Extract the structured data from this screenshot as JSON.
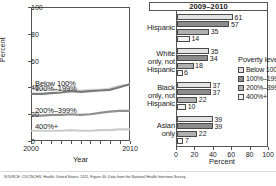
{
  "source_note": "SOURCE: CDC/NCHS, Health, United States, 2011, Figure 40. Data from the National Health Interview Survey.",
  "colors": {
    "below100": "#e2e2e2",
    "p100_199": "#8c8c8c",
    "p200_399": "#b0b0b0",
    "p400plus": "#f2f2f2",
    "axis": "#555555",
    "line_below100": "#d9d9d9",
    "line_100_199": "#7a7a7a",
    "line_200_399": "#8f8f8f",
    "line_400plus": "#cccccc"
  },
  "legend": {
    "title": "Poverty level",
    "items": [
      {
        "label": "Below 100%",
        "color": "#e2e2e2"
      },
      {
        "label": "100%–199%",
        "color": "#8c8c8c"
      },
      {
        "label": "200%–399%",
        "color": "#b0b0b0"
      },
      {
        "label": "400%+",
        "color": "#f2f2f2"
      }
    ]
  },
  "chart_data": [
    {
      "type": "line",
      "panel": "left",
      "title": "",
      "xlabel": "Year",
      "ylabel": "Percent",
      "xlim": [
        2000,
        2010
      ],
      "ylim": [
        0,
        100
      ],
      "yticks": [
        0,
        20,
        40,
        60,
        80,
        100
      ],
      "xticks": [
        2000,
        2001,
        2002,
        2003,
        2004,
        2005,
        2006,
        2007,
        2008,
        2009,
        2010
      ],
      "xticklabels": [
        "2000",
        "",
        "",
        "",
        "",
        "",
        "",
        "",
        "",
        "",
        "2010"
      ],
      "grid": false,
      "legend_position": "inline-labels",
      "x": [
        2000,
        2001,
        2002,
        2003,
        2004,
        2005,
        2006,
        2007,
        2008,
        2009,
        2010
      ],
      "series": [
        {
          "name": "Below 100%",
          "label": "Below 100%",
          "color": "#d9d9d9",
          "values": [
            39,
            38.5,
            38,
            38,
            38,
            37.5,
            38,
            38,
            39,
            41,
            42
          ]
        },
        {
          "name": "100%–199%",
          "label": "100%–199%",
          "color": "#7a7a7a",
          "values": [
            35,
            35,
            35.5,
            36,
            37,
            36.5,
            37,
            37.5,
            38,
            40,
            42
          ]
        },
        {
          "name": "200%–399%",
          "label": "200%–399%",
          "color": "#8f8f8f",
          "values": [
            18.5,
            18.5,
            19,
            19,
            19.5,
            19,
            19.5,
            20.5,
            21.5,
            22,
            22
          ]
        },
        {
          "name": "400%+",
          "label": "400%+",
          "color": "#cccccc",
          "values": [
            7,
            7,
            7,
            7,
            7.5,
            7,
            7,
            7.5,
            7.5,
            8,
            8
          ]
        }
      ]
    },
    {
      "type": "bar",
      "panel": "right",
      "orientation": "horizontal",
      "title": "2009–2010",
      "xlabel": "Percent",
      "ylabel": "",
      "xlim": [
        0,
        100
      ],
      "xticks": [
        0,
        20,
        40,
        60,
        80,
        100
      ],
      "grid": false,
      "legend_position": "inside-right",
      "categories": [
        "Hispanic",
        "White only, not Hispanic",
        "Black only, not Hispanic",
        "Asian only"
      ],
      "category_lines": [
        [
          "Hispanic"
        ],
        [
          "White",
          "only, not",
          "Hispanic"
        ],
        [
          "Black",
          "only, not",
          "Hispanic"
        ],
        [
          "Asian",
          "only"
        ]
      ],
      "series": [
        {
          "name": "Below 100%",
          "color": "#e2e2e2",
          "values": [
            61,
            35,
            37,
            39
          ]
        },
        {
          "name": "100%–199%",
          "color": "#8c8c8c",
          "values": [
            57,
            34,
            37,
            39
          ]
        },
        {
          "name": "200%–399%",
          "color": "#b0b0b0",
          "values": [
            35,
            18,
            22,
            22
          ]
        },
        {
          "name": "400%+",
          "color": "#f2f2f2",
          "values": [
            14,
            6,
            10,
            7
          ]
        }
      ]
    }
  ]
}
